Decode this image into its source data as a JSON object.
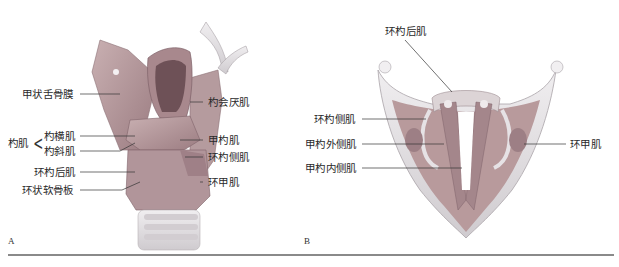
{
  "figure": {
    "panel_a": {
      "letter": "A",
      "labels": {
        "thyrohyoid_membrane": "甲状舌骨膜",
        "aryepiglottic": "杓会厌肌",
        "arytenoid_group": "杓肌",
        "transverse_arytenoid": "杓横肌",
        "oblique_arytenoid": "杓斜肌",
        "thyroarytenoid": "甲杓肌",
        "lateral_cricoarytenoid": "环杓侧肌",
        "posterior_cricoarytenoid": "环杓后肌",
        "cricothyroid": "环甲肌",
        "cricoid_lamina": "环状软骨板"
      }
    },
    "panel_b": {
      "letter": "B",
      "labels": {
        "posterior_cricoarytenoid": "环杓后肌",
        "lateral_cricoarytenoid": "环杓侧肌",
        "external_thyroarytenoid": "甲杓外侧肌",
        "internal_thyroarytenoid": "甲杓内侧肌",
        "cricothyroid": "环甲肌"
      }
    },
    "colors": {
      "muscle": "#b89a9c",
      "muscle_dark": "#8c6e72",
      "cartilage": "#d8d4d6",
      "cartilage_light": "#ecebee",
      "line": "#333333",
      "rule": "#8a8a8a"
    }
  }
}
